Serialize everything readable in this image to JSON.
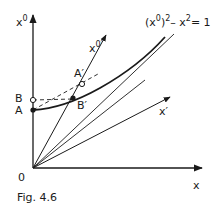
{
  "figure": {
    "caption": "Fig. 4.6",
    "axes": {
      "x": "x",
      "x0_base": "x",
      "x0_sup": "0",
      "xprime": "x′",
      "x0prime_base": "x",
      "x0prime_sup": "0′"
    },
    "origin": "0",
    "points": {
      "A": "A",
      "B": "B",
      "Aprime": "A′",
      "Bprime": "B′"
    },
    "equation": {
      "open": "(x",
      "sup0": "0",
      "close": ")",
      "sup2a": "2",
      "minus_x": "– x",
      "sup2b": "2",
      "rhs": "= 1"
    },
    "colors": {
      "ink": "#1a1a1a",
      "background": "#ffffff"
    }
  }
}
